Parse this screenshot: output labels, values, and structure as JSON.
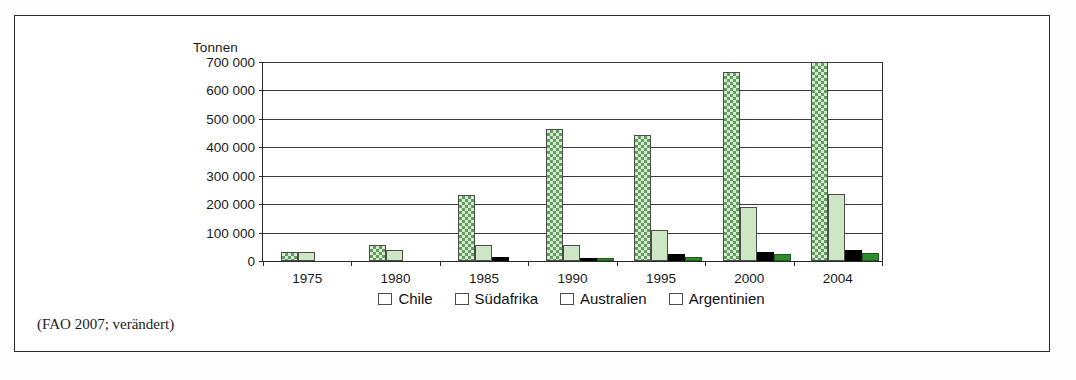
{
  "page": {
    "top_text_fragment": "",
    "source_caption": "(FAO 2007; verändert)"
  },
  "chart_data": {
    "type": "bar",
    "title": "",
    "xlabel": "",
    "ylabel": "Tonnen",
    "ylim": [
      0,
      700000
    ],
    "grid": true,
    "legend_position": "bottom",
    "categories": [
      "1975",
      "1980",
      "1985",
      "1990",
      "1995",
      "2000",
      "2004"
    ],
    "ytick_labels": [
      "700 000",
      "600 000",
      "500 000",
      "400 000",
      "300 000",
      "200 000",
      "100 000",
      "0"
    ],
    "ytick_values": [
      700000,
      600000,
      500000,
      400000,
      300000,
      200000,
      100000,
      0
    ],
    "series": [
      {
        "name": "Chile",
        "color": "#d9ead3",
        "pattern": "checker",
        "values": [
          30000,
          55000,
          232000,
          465000,
          443000,
          665000,
          700000
        ]
      },
      {
        "name": "Südafrika",
        "color": "#cde6c4",
        "pattern": "solid",
        "values": [
          31000,
          38000,
          58000,
          57000,
          108000,
          190000,
          236000
        ]
      },
      {
        "name": "Australien",
        "color": "#000000",
        "pattern": "solid",
        "values": [
          0,
          0,
          13000,
          9000,
          23000,
          33000,
          38000
        ]
      },
      {
        "name": "Argentinien",
        "color": "#2e8b2e",
        "pattern": "solid",
        "values": [
          0,
          0,
          0,
          11000,
          14000,
          26000,
          28000
        ]
      }
    ]
  }
}
